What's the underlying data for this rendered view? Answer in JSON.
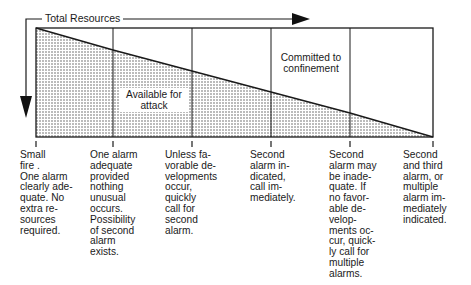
{
  "diagram": {
    "arrow_label": "Total Resources",
    "regions": {
      "committed": "Committed to\nconfinement",
      "available": "Available for\nattack"
    },
    "stages": [
      {
        "label": "Small\nfire .\nOne alarm\nclearly ade-\nquate. No\nextra re-\nsources\nrequired."
      },
      {
        "label": "One alarm\nadequate\nprovided\nnothing\nunusual\noccurs.\nPossibility\nof second\nalarm\nexists."
      },
      {
        "label": "Unless fa-\nvorable de-\nvelopments\noccur,\nquickly\ncall for\nsecond\nalarm."
      },
      {
        "label": "Second\nalarm in-\ndicated,\ncall im-\nmediately."
      },
      {
        "label": "Second\nalarm may\nbe inade-\nquate. If\nno favor-\nable de-\nvelop-\nments oc-\ncur, quick-\nly call for\nmultiple\nalarms."
      },
      {
        "label": "Second\nand third\nalarm, or\nmultiple\nalarm im-\nmediately\nindicated."
      }
    ],
    "colors": {
      "line": "#1a1a1a",
      "dots": "#555555"
    }
  }
}
